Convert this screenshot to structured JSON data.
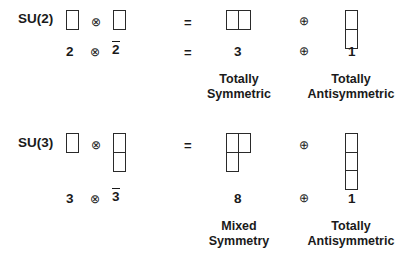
{
  "figure": {
    "type": "young-tableaux-decomposition",
    "background": "#ffffff",
    "ink": "#1a1a1a"
  },
  "symbols": {
    "tensor": "⊗",
    "oplus": "⊕",
    "equals": "="
  },
  "rows": [
    {
      "group_label": "SU(2)",
      "left_tableau": {
        "name": "single-box",
        "shape": [
          1
        ]
      },
      "right_tableau": {
        "name": "single-box",
        "shape": [
          1
        ]
      },
      "result_tableau": {
        "name": "two-box-row",
        "shape": [
          2
        ]
      },
      "second_result_tableau": {
        "name": "two-box-column",
        "shape": [
          1,
          1
        ]
      },
      "dims": {
        "left": "2",
        "right": "2",
        "right_conjugate": true,
        "result": "3",
        "second_result": "1"
      },
      "captions": {
        "result": "Totally\nSymmetric",
        "second_result": "Totally\nAntisymmetric"
      }
    },
    {
      "group_label": "SU(3)",
      "left_tableau": {
        "name": "single-box",
        "shape": [
          1
        ]
      },
      "right_tableau": {
        "name": "two-box-column",
        "shape": [
          1,
          1
        ]
      },
      "result_tableau": {
        "name": "l-shape-three-box",
        "shape": [
          2,
          1
        ]
      },
      "second_result_tableau": {
        "name": "three-box-column",
        "shape": [
          1,
          1,
          1
        ]
      },
      "dims": {
        "left": "3",
        "right": "3",
        "right_conjugate": true,
        "result": "8",
        "second_result": "1"
      },
      "captions": {
        "result": "Mixed\nSymmetry",
        "second_result": "Totally\nAntisymmetric"
      }
    }
  ]
}
